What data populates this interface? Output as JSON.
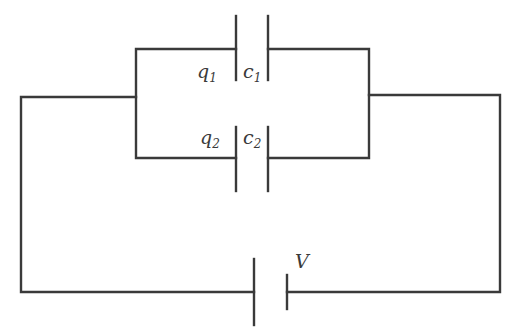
{
  "diagram": {
    "type": "circuit",
    "stroke_color": "#3a3a3a",
    "components": {
      "capacitor_1": {
        "charge_label": "q",
        "charge_sub": "1",
        "cap_label": "c",
        "cap_sub": "1"
      },
      "capacitor_2": {
        "charge_label": "q",
        "charge_sub": "2",
        "cap_label": "c",
        "cap_sub": "2"
      },
      "battery": {
        "label": "V"
      }
    }
  }
}
